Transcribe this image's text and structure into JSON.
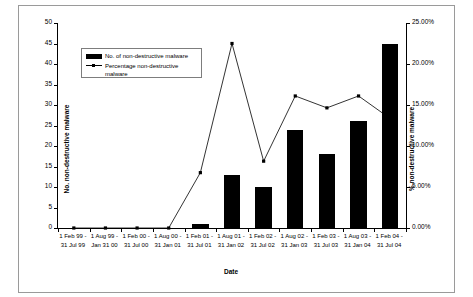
{
  "chart_data": {
    "type": "bar",
    "title": "",
    "xlabel": "Date",
    "ylabel": "No. non-destructive malware",
    "ylabel_secondary": "% non-destructive malware",
    "grid": false,
    "legend_position": "upper-left-inside",
    "ylim": [
      0,
      50
    ],
    "ylim_secondary": [
      0,
      25
    ],
    "ytick_labels": [
      "0",
      "5",
      "10",
      "15",
      "20",
      "25",
      "30",
      "35",
      "40",
      "45",
      "50"
    ],
    "ytick_values": [
      0,
      5,
      10,
      15,
      20,
      25,
      30,
      35,
      40,
      45,
      50
    ],
    "ytick_labels_secondary": [
      "0.00%",
      "5.00%",
      "10.00%",
      "15.00%",
      "20.00%",
      "25.00%"
    ],
    "ytick_values_secondary": [
      0,
      5,
      10,
      15,
      20,
      25
    ],
    "categories": [
      "1 Feb 99 -\n31 Jul 99",
      "1 Aug 99 -\nJan 31 00",
      "1 Feb 00 -\n31 Jul 00",
      "1 Aug 00 -\n31 Jan 01",
      "1 Feb 01 -\n31 Jul 01",
      "1 Aug 01 -\n31 Jan 02",
      "1 Feb 02 -\n31 Jul 02",
      "1 Aug 02 -\n31 Jan 03",
      "1 Feb 03 -\n31 Jul 03",
      "1 Aug 03 -\n31 Jan 04",
      "1 Feb 04 -\n31 Jul 04"
    ],
    "categories_lines": [
      [
        "1 Feb 99 -",
        "31 Jul 99"
      ],
      [
        "1 Aug 99 -",
        "Jan 31 00"
      ],
      [
        "1 Feb 00 -",
        "31 Jul 00"
      ],
      [
        "1 Aug 00 -",
        "31 Jan 01"
      ],
      [
        "1 Feb 01 -",
        "31 Jul 01"
      ],
      [
        "1 Aug 01 -",
        "31 Jan 02"
      ],
      [
        "1 Feb 02 -",
        "31 Jul 02"
      ],
      [
        "1 Aug 02 -",
        "31 Jan 03"
      ],
      [
        "1 Feb 03 -",
        "31 Jul 03"
      ],
      [
        "1 Aug 03 -",
        "31 Jan 04"
      ],
      [
        "1 Feb 04 -",
        "31 Jul 04"
      ]
    ],
    "series": [
      {
        "name": "No. of non-destructive malware",
        "type": "bar",
        "axis": "left",
        "color": "#000000",
        "values": [
          0,
          0,
          0,
          0,
          1,
          13,
          10,
          24,
          18,
          26,
          45
        ]
      },
      {
        "name": "Percentage non-destructive malware",
        "type": "line",
        "axis": "right",
        "color": "#000000",
        "values": [
          0,
          0,
          0,
          0,
          6.75,
          22.5,
          8.15,
          16.1,
          14.65,
          16.1,
          13.35
        ]
      }
    ]
  },
  "legend": {
    "entries": [
      {
        "label": "No. of non-destructive malware",
        "marker": "bar-swatch"
      },
      {
        "label": "Percentage non-destructive malware",
        "marker": "line-marker-swatch"
      }
    ]
  }
}
